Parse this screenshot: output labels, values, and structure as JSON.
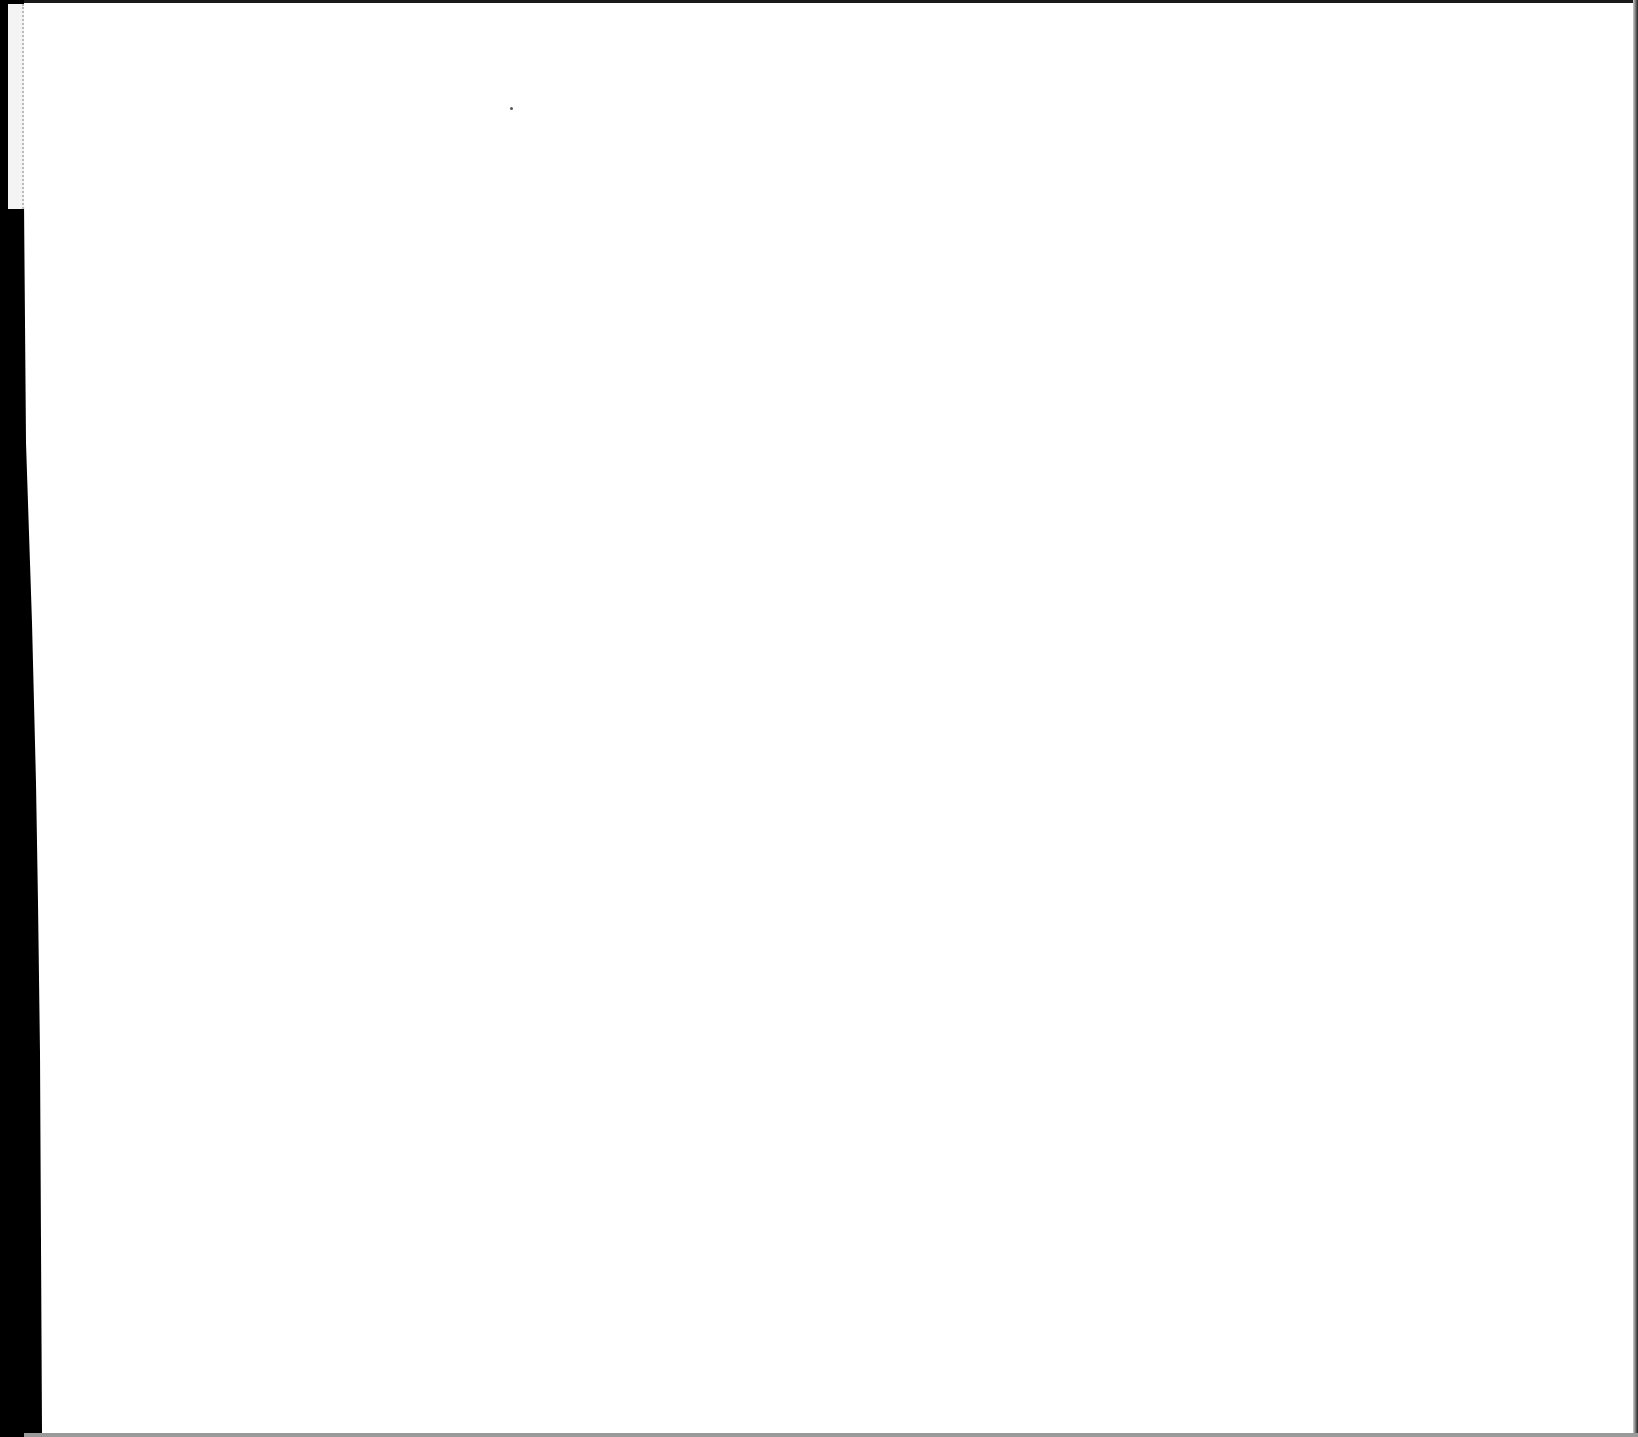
{
  "document": {
    "content": []
  }
}
